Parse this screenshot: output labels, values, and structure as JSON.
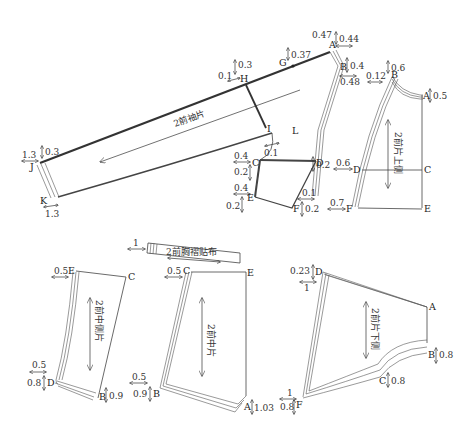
{
  "diagram": {
    "pieces": {
      "sleeve": {
        "label": "2前袖片",
        "points": [
          "G",
          "H",
          "I",
          "J",
          "K",
          "L",
          "A",
          "B",
          "C",
          "D",
          "E",
          "F"
        ]
      },
      "upper_side": {
        "label": "2前片上侧",
        "points": [
          "A",
          "B",
          "C",
          "D",
          "E",
          "F"
        ]
      },
      "middle_side": {
        "label": "2前中侧片",
        "points": [
          "B",
          "C",
          "D",
          "E"
        ]
      },
      "pleat_patch": {
        "label": "2前胸褶贴布"
      },
      "middle": {
        "label": "2前中片",
        "points": [
          "A",
          "B",
          "C",
          "E"
        ]
      },
      "lower_side": {
        "label": "2前片下侧",
        "points": [
          "A",
          "B",
          "C",
          "D",
          "F"
        ]
      }
    },
    "points": {
      "sleeve": {
        "A": "A",
        "B": "B",
        "C": "C",
        "D": "D",
        "E": "E",
        "F": "F",
        "G": "G",
        "H": "H",
        "I": "I",
        "J": "J",
        "K": "K",
        "L": "L"
      },
      "upper": {
        "A": "A",
        "B": "B",
        "C": "C",
        "D": "D",
        "E": "E",
        "F": "F"
      },
      "midside": {
        "B": "B",
        "C": "C",
        "D": "D",
        "E": "E"
      },
      "middle": {
        "A": "A",
        "B": "B",
        "C": "C",
        "E": "E"
      },
      "lower": {
        "A": "A",
        "B": "B",
        "C": "C",
        "D": "D",
        "F": "F"
      }
    },
    "measurements": {
      "sleeve": {
        "A_v": "0.47",
        "A_h": "0.44",
        "B_v": "0.4",
        "B_h": "0.48",
        "G_v": "0.37",
        "H_v": "0.3",
        "H_h": "0.1",
        "J_h": "1.3",
        "J_v": "0.3",
        "K_h": "1.3",
        "L_h": "0.1",
        "C_h": "0.4",
        "C_v": "0.2",
        "D_v": "0.2",
        "E_h": "0.4",
        "E_v": "0.2",
        "F_h": "0.1",
        "F_v": "0.2"
      },
      "upper": {
        "B_v": "0.6",
        "B_h": "0.12",
        "A_v": "0.5",
        "D_h": "0.6",
        "F_h": "0.7"
      },
      "midside": {
        "E_h": "0.5",
        "D_h": "0.5",
        "D_v": "0.8",
        "B_v": "0.9"
      },
      "patch": {
        "h": "1"
      },
      "middle": {
        "C_h": "0.5",
        "B_h": "0.5",
        "B_v": "0.9",
        "A_v": "1.03"
      },
      "lower": {
        "D_v": "0.23",
        "D_h": "1",
        "B_v": "0.8",
        "C_v": "0.8",
        "F_h": "1",
        "F_v": "0.8"
      }
    }
  }
}
